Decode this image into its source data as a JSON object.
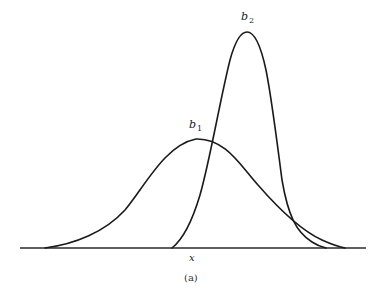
{
  "figure": {
    "caption": "(a)",
    "x_axis_label": "x",
    "curves": [
      {
        "name": "b",
        "subscript": "1",
        "description": "wide, low normal curve",
        "peak_x_px": 196,
        "peak_y_px": 139,
        "start_x_px": 45,
        "end_x_px": 345
      },
      {
        "name": "b",
        "subscript": "2",
        "description": "narrow, tall normal curve",
        "peak_x_px": 247,
        "peak_y_px": 32,
        "start_x_px": 172,
        "end_x_px": 326
      }
    ],
    "colors": {
      "line": "#1a1a1a",
      "background": "#ffffff"
    }
  }
}
